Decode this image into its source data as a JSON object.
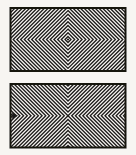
{
  "figure": {
    "paper_color": "#f7f5f2",
    "panel_fill": "#f6f4f1",
    "ink_color": "#1e1c1a",
    "border_color": "#17140f",
    "border_width": 2,
    "canvas": {
      "width": 136,
      "height": 155
    },
    "panels": [
      {
        "name": "concentric-diamonds-panel",
        "type": "concentric-diamonds",
        "x": 10.5,
        "y": 8,
        "width": 115,
        "height": 63,
        "period": 3.7,
        "stroke_width": 1.35,
        "start_radius": 3.0,
        "center_dot_radius": 1.1
      },
      {
        "name": "x-chevrons-panel",
        "type": "x-chevrons",
        "x": 10.5,
        "y": 84,
        "width": 115,
        "height": 63.5,
        "period": 3.7,
        "stroke_width": 1.35,
        "arrow": {
          "present": true,
          "base_x": 12.2,
          "tip_x": 18.0,
          "half_height": 3.15
        }
      }
    ]
  }
}
